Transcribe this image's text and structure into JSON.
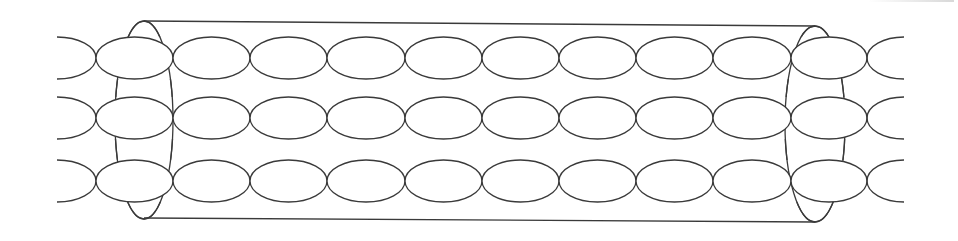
{
  "diagram": {
    "title": "",
    "colors": {
      "background": "#ffffff",
      "stroke": "#3a3a3a"
    },
    "tube": {
      "top_line": {
        "x1": 144,
        "y1": 21,
        "x2": 815,
        "y2": 26
      },
      "bottom_line": {
        "x1": 144,
        "y1": 218,
        "x2": 815,
        "y2": 222
      },
      "left_cap": {
        "cx": 144,
        "cy": 120,
        "rx": 29,
        "ry": 99
      },
      "right_cap": {
        "cx": 815,
        "cy": 124,
        "rx": 30,
        "ry": 98
      }
    },
    "chains": {
      "count": 3,
      "rows": [
        {
          "cy": 58
        },
        {
          "cy": 118
        },
        {
          "cy": 181
        }
      ],
      "ellipse_rx": 38.5,
      "ellipse_ry": 21,
      "full_ellipse_x_starts": [
        96,
        173,
        250,
        327,
        405,
        482,
        559,
        636,
        713,
        791
      ],
      "left_partial": {
        "x_start": 57,
        "x_end": 96
      },
      "right_partial": {
        "x_start": 867,
        "x_end": 904
      }
    }
  }
}
